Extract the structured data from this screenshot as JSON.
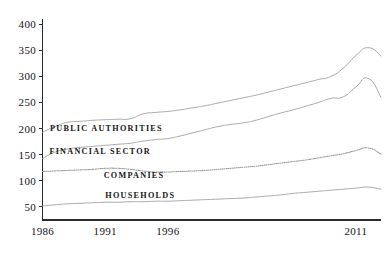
{
  "chart_data": {
    "type": "line",
    "title": "",
    "subtitle": "",
    "xlabel": "",
    "ylabel": "",
    "xlim": [
      1986,
      2013
    ],
    "ylim": [
      25,
      410
    ],
    "grid": false,
    "legend_position": "inline-on-plot",
    "y_ticks": [
      "50",
      "100",
      "150",
      "200",
      "250",
      "300",
      "350",
      "400"
    ],
    "y_tick_values": [
      50,
      100,
      150,
      200,
      250,
      300,
      350,
      400
    ],
    "x_ticks": [
      "1986",
      "1991",
      "1996",
      "2011"
    ],
    "x_tick_values": [
      1986,
      1991,
      1996,
      2011
    ],
    "x": [
      1986,
      1987,
      1988,
      1989,
      1990,
      1991,
      1992,
      1993,
      1994,
      1995,
      1996,
      1997,
      1998,
      1999,
      2000,
      2001,
      2002,
      2003,
      2004,
      2005,
      2006,
      2007,
      2008,
      2009,
      2010,
      2011,
      2012,
      2013
    ],
    "series": [
      {
        "name": "PUBLIC AUTHORITIES",
        "style": "solid",
        "label_x": 1991.1,
        "label_y": 196,
        "values": [
          193,
          204,
          212,
          214,
          216,
          217,
          218,
          219,
          228,
          231,
          233,
          236,
          240,
          244,
          249,
          254,
          259,
          264,
          270,
          276,
          282,
          288,
          294,
          300,
          316,
          340,
          355,
          339
        ]
      },
      {
        "name": "FINANCIAL SECTOR",
        "style": "solid",
        "label_x": 1990.6,
        "label_y": 152,
        "values": [
          143,
          155,
          161,
          164,
          166,
          168,
          170,
          172,
          176,
          179,
          181,
          186,
          192,
          198,
          204,
          208,
          211,
          216,
          223,
          230,
          236,
          243,
          250,
          258,
          261,
          280,
          296,
          260
        ]
      },
      {
        "name": "COMPANIES",
        "style": "dotted",
        "label_x": 1993.3,
        "label_y": 106,
        "values": [
          118,
          119,
          120,
          121,
          122,
          124,
          124,
          122,
          119,
          117,
          117,
          118,
          119,
          120,
          122,
          124,
          126,
          128,
          131,
          134,
          137,
          140,
          144,
          148,
          152,
          158,
          163,
          151
        ]
      },
      {
        "name": "HOUSEHOLDS",
        "style": "solid",
        "label_x": 1993.8,
        "label_y": 68,
        "values": [
          52,
          54,
          56,
          57,
          58,
          59,
          59,
          60,
          60,
          61,
          61,
          62,
          63,
          64,
          65,
          66,
          67,
          69,
          71,
          73,
          76,
          78,
          80,
          82,
          84,
          86,
          88,
          84
        ]
      }
    ]
  }
}
